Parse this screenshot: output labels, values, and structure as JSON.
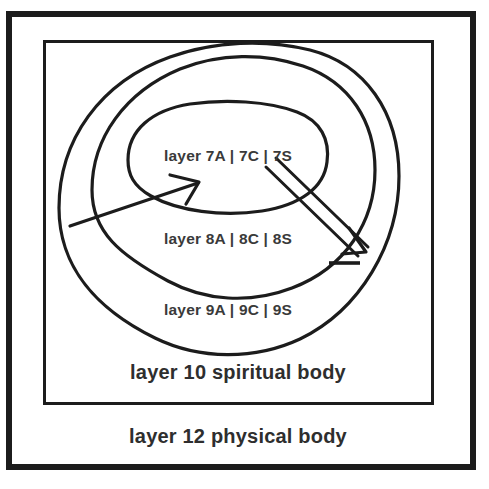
{
  "diagram": {
    "background_color": "#ffffff",
    "line_color": "#1c1c1c",
    "text_color": "#3a3a3a",
    "outer_frame": {
      "name": "outer-border"
    },
    "inner_frame": {
      "name": "inner-border"
    },
    "rings": [
      {
        "id": "ring-7",
        "label": "layer 7A | 7C | 7S",
        "position": "innermost"
      },
      {
        "id": "ring-8",
        "label": "layer 8A | 8C | 8S",
        "position": "middle"
      },
      {
        "id": "ring-9",
        "label": "layer 9A | 9C | 9S",
        "position": "outer"
      }
    ],
    "bodies": [
      {
        "id": "body-10",
        "label": "layer 10 spiritual body"
      },
      {
        "id": "body-12",
        "label": "layer 12 physical body"
      }
    ],
    "arrows": [
      {
        "id": "arrow-inward",
        "style": "single-line",
        "direction": "up-right",
        "description": "thin arrow pointing inward toward layer 7"
      },
      {
        "id": "arrow-outward",
        "style": "double-line",
        "direction": "down-right",
        "description": "hollow double-line arrow pointing outward from layer 7"
      }
    ]
  }
}
